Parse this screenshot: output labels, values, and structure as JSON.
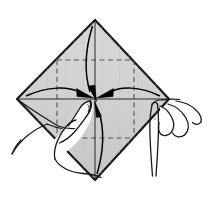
{
  "figure": {
    "title": "Origami fold step: collapse four corners to center",
    "caption": "",
    "background_color": "#ffffff",
    "paper": {
      "name": "square-paper-diamond",
      "fill_color": "#d2d2d2",
      "shade_color": "#c4c4c4",
      "outline_color": "#1a1a1a",
      "outline_width": 2.2,
      "description": "Square sheet oriented as a diamond",
      "vertices": [
        {
          "label": "top",
          "x": 95,
          "y": 20
        },
        {
          "label": "right",
          "x": 169,
          "y": 99
        },
        {
          "label": "bottom",
          "x": 95,
          "y": 180
        },
        {
          "label": "left",
          "x": 17,
          "y": 99
        }
      ]
    },
    "crease_lines": {
      "name": "dashed-crease-square",
      "color": "#555555",
      "width": 1.1,
      "dash_pattern": "5,3.5",
      "square": {
        "left": 57,
        "top": 60,
        "right": 134,
        "bottom": 138
      },
      "axes": {
        "horizontal_y": 99,
        "vertical_x": 95
      }
    },
    "solid_center_axes": {
      "name": "center-axis-lines",
      "color": "#2a2a2a",
      "width": 1.0,
      "horizontal": {
        "x1": 17,
        "x2": 169,
        "y": 99
      },
      "vertical": {
        "y1": 20,
        "y2": 180,
        "x": 95
      }
    },
    "arrows": {
      "color": "#000000",
      "width": 1.4,
      "target": {
        "x": 95,
        "y": 99
      },
      "items": [
        {
          "name": "arrow-from-top",
          "from": "top",
          "to": "center",
          "direction": "down"
        },
        {
          "name": "arrow-from-left",
          "from": "left",
          "to": "center",
          "direction": "right"
        },
        {
          "name": "arrow-from-right",
          "from": "right",
          "to": "center",
          "direction": "left"
        },
        {
          "name": "arrow-from-bottom",
          "from": "bottom",
          "to": "center",
          "direction": "up"
        }
      ]
    },
    "hands": {
      "outline_color": "#1a1a1a",
      "fill_color": "#ffffff",
      "outline_width": 1.3,
      "items": [
        {
          "name": "left-hand",
          "side": "left",
          "description": "Left hand, index finger extended upward pressing toward the paper center"
        },
        {
          "name": "right-hand",
          "side": "right",
          "description": "Right hand gripping the right corner of the paper with thumb and fingers"
        }
      ]
    }
  },
  "chart_data": {
    "type": "diagram",
    "title": "Origami fold step: collapse four corners to center",
    "elements": [
      "square-paper-diamond",
      "dashed-crease-square",
      "four-converging-arrows",
      "left-hand",
      "right-hand"
    ]
  }
}
